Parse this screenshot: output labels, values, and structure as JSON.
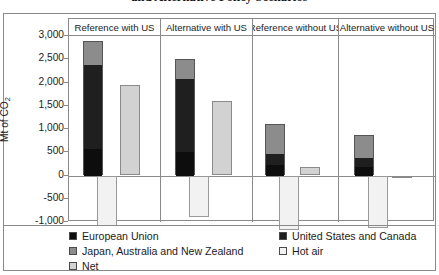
{
  "title": "and Alternative Policy Scenarios",
  "axis": {
    "ylabel_prefix": "Mt of CO",
    "ylabel_sub": "2"
  },
  "legend": {
    "left": [
      {
        "label": "European Union",
        "color": "#0d0d0d",
        "swatch": "european-union"
      },
      {
        "label": "Japan, Australia and New Zealand",
        "color": "#8c8c8c",
        "swatch": "japan-australia-new-zealand"
      },
      {
        "label": "Net",
        "color": "#d2d2d2",
        "swatch": "net"
      }
    ],
    "right": [
      {
        "label": "United States and Canada",
        "color": "#1f1f1f",
        "swatch": "united-states-and-canada"
      },
      {
        "label": "Hot air",
        "color": "#f2f2f2",
        "swatch": "hot-air"
      }
    ]
  },
  "chart_data": {
    "type": "bar",
    "subtype": "stacked-with-net",
    "title": "and Alternative Policy Scenarios",
    "xlabel": "",
    "ylabel": "Mt of CO2",
    "ylim": [
      -1000,
      3000
    ],
    "yticks": [
      "3,000",
      "2,500",
      "2,000",
      "1,500",
      "1,000",
      "500",
      "0",
      "-500",
      "-1,000"
    ],
    "ytick_values": [
      3000,
      2500,
      2000,
      1500,
      1000,
      500,
      0,
      -500,
      -1000
    ],
    "grid": false,
    "legend_position": "bottom",
    "categories": [
      "Reference with US",
      "Alternative with US",
      "Reference without US",
      "Alternative without US"
    ],
    "series": [
      {
        "name": "European Union",
        "color": "#0d0d0d",
        "values": [
          600,
          530,
          250,
          210
        ]
      },
      {
        "name": "United States and Canada",
        "color": "#1f1f1f",
        "values": [
          1800,
          1570,
          230,
          190
        ]
      },
      {
        "name": "Japan, Australia and New Zealand",
        "color": "#8c8c8c",
        "values": [
          490,
          410,
          620,
          480
        ]
      },
      {
        "name": "Hot air",
        "color": "#f2f2f2",
        "values": [
          -1080,
          -900,
          -1180,
          -1120
        ]
      },
      {
        "name": "Net",
        "color": "#d2d2d2",
        "values": [
          1950,
          1610,
          180,
          -60
        ]
      }
    ],
    "panels": [
      {
        "label": "Reference with US",
        "stack": [
          {
            "name": "European Union",
            "value": 600
          },
          {
            "name": "United States and Canada",
            "value": 1800
          },
          {
            "name": "Japan, Australia and New Zealand",
            "value": 490
          }
        ],
        "stack_total": 2890,
        "hot_air": -1080,
        "net": 1950
      },
      {
        "label": "Alternative with US",
        "stack": [
          {
            "name": "European Union",
            "value": 530
          },
          {
            "name": "United States and Canada",
            "value": 1570
          },
          {
            "name": "Japan, Australia and New Zealand",
            "value": 410
          }
        ],
        "stack_total": 2510,
        "hot_air": -900,
        "net": 1610
      },
      {
        "label": "Reference without US",
        "stack": [
          {
            "name": "European Union",
            "value": 250
          },
          {
            "name": "United States and Canada",
            "value": 230
          },
          {
            "name": "Japan, Australia and New Zealand",
            "value": 620
          }
        ],
        "stack_total": 1100,
        "hot_air": -1180,
        "net": 180
      },
      {
        "label": "Alternative without US",
        "stack": [
          {
            "name": "European Union",
            "value": 210
          },
          {
            "name": "United States and Canada",
            "value": 190
          },
          {
            "name": "Japan, Australia and New Zealand",
            "value": 480
          }
        ],
        "stack_total": 880,
        "hot_air": -1120,
        "net": -60
      }
    ]
  }
}
